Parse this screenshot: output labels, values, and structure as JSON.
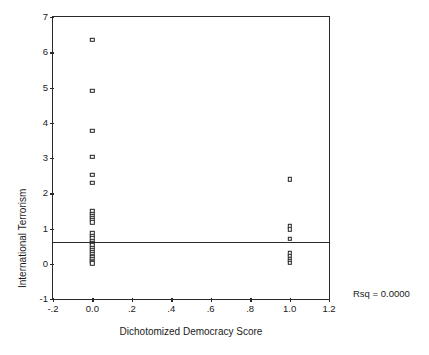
{
  "chart_data": {
    "type": "scatter",
    "title": "",
    "xlabel": "Dichotomized Democracy Score",
    "ylabel": "International Terrorism",
    "xlim": [
      -0.2,
      1.2
    ],
    "ylim": [
      -1,
      7
    ],
    "xticks": [
      -0.2,
      0.0,
      0.2,
      0.4,
      0.6,
      0.8,
      1.0,
      1.2
    ],
    "xticklabels": [
      "-.2",
      "0.0",
      ".2",
      ".4",
      ".6",
      ".8",
      "1.0",
      "1.2"
    ],
    "yticks": [
      -1,
      0,
      1,
      2,
      3,
      4,
      5,
      6,
      7
    ],
    "yticklabels": [
      "-1",
      "0",
      "1",
      "2",
      "3",
      "4",
      "5",
      "6",
      "7"
    ],
    "grid": false,
    "legend": null,
    "marker_style": "open-square",
    "annotations": [
      {
        "name": "rsq",
        "text": "Rsq = 0.0000",
        "x": 1.35,
        "y": -0.6
      }
    ],
    "reference_line": {
      "type": "horizontal",
      "y": 0.62,
      "label": "regression-line"
    },
    "series": [
      {
        "name": "observations",
        "points": [
          {
            "x": 0.0,
            "y": 6.35
          },
          {
            "x": 0.0,
            "y": 4.9
          },
          {
            "x": 0.0,
            "y": 3.78
          },
          {
            "x": 0.0,
            "y": 3.03
          },
          {
            "x": 0.0,
            "y": 2.52
          },
          {
            "x": 0.0,
            "y": 2.3
          },
          {
            "x": 0.0,
            "y": 1.49
          },
          {
            "x": 0.0,
            "y": 1.42
          },
          {
            "x": 0.0,
            "y": 1.36
          },
          {
            "x": 0.0,
            "y": 1.3
          },
          {
            "x": 0.0,
            "y": 1.24
          },
          {
            "x": 0.0,
            "y": 1.18
          },
          {
            "x": 0.0,
            "y": 0.86
          },
          {
            "x": 0.0,
            "y": 0.8
          },
          {
            "x": 0.0,
            "y": 0.72
          },
          {
            "x": 0.0,
            "y": 0.64
          },
          {
            "x": 0.0,
            "y": 0.58
          },
          {
            "x": 0.0,
            "y": 0.52
          },
          {
            "x": 0.0,
            "y": 0.46
          },
          {
            "x": 0.0,
            "y": 0.4
          },
          {
            "x": 0.0,
            "y": 0.34
          },
          {
            "x": 0.0,
            "y": 0.28
          },
          {
            "x": 0.0,
            "y": 0.23
          },
          {
            "x": 0.0,
            "y": 0.18
          },
          {
            "x": 0.0,
            "y": 0.13
          },
          {
            "x": 0.0,
            "y": 0.09
          },
          {
            "x": 0.0,
            "y": 0.05
          },
          {
            "x": 0.0,
            "y": 0.01
          },
          {
            "x": 1.0,
            "y": 2.4
          },
          {
            "x": 1.0,
            "y": 1.06
          },
          {
            "x": 1.0,
            "y": 0.98
          },
          {
            "x": 1.0,
            "y": 0.7
          },
          {
            "x": 1.0,
            "y": 0.3
          },
          {
            "x": 1.0,
            "y": 0.22
          },
          {
            "x": 1.0,
            "y": 0.14
          },
          {
            "x": 1.0,
            "y": 0.08
          },
          {
            "x": 1.0,
            "y": 0.03
          }
        ]
      }
    ]
  }
}
